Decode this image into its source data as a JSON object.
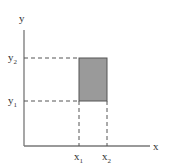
{
  "diagram": {
    "axes": {
      "x_label": "x",
      "y_label": "y"
    },
    "x_ticks": [
      {
        "base": "x",
        "sub": "1"
      },
      {
        "base": "x",
        "sub": "2"
      }
    ],
    "y_ticks": [
      {
        "base": "y",
        "sub": "2"
      },
      {
        "base": "y",
        "sub": "1"
      }
    ],
    "rectangle": {
      "fill": "#9a9a9a",
      "stroke": "#555555"
    },
    "colors": {
      "axis": "#666666",
      "dash": "#555555"
    }
  }
}
